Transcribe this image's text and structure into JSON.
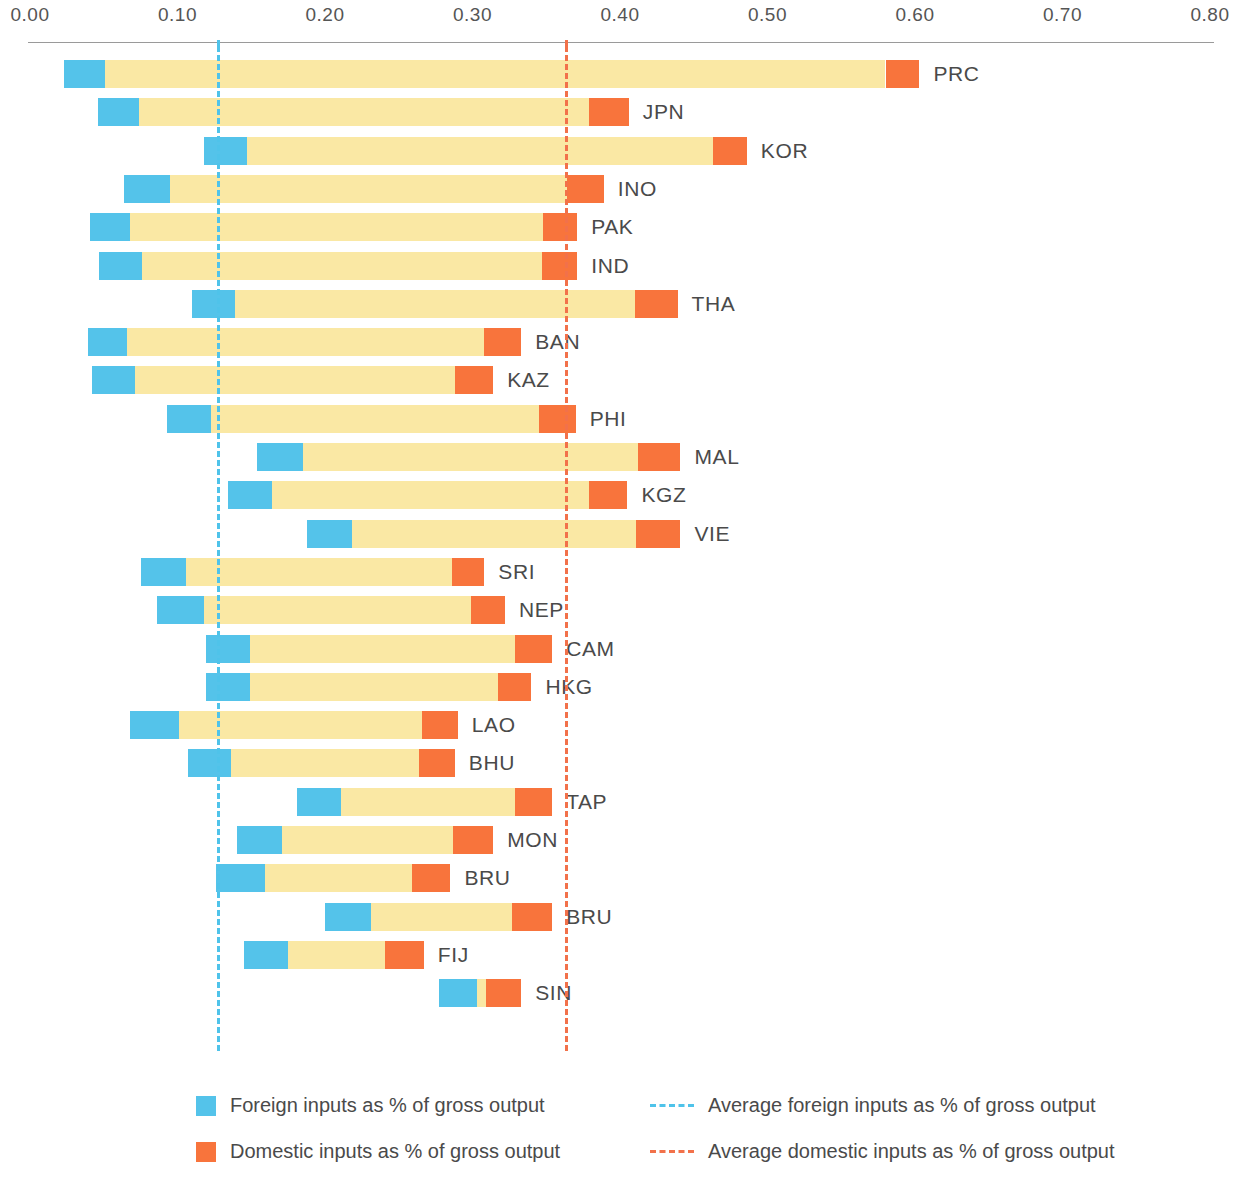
{
  "chart_data": {
    "type": "bar",
    "title": "",
    "subtitle": "",
    "xlabel": "",
    "ylabel": "",
    "orientation": "horizontal",
    "stacked": true,
    "grid": false,
    "xlim": [
      0.0,
      0.8
    ],
    "xticks": [
      0.0,
      0.1,
      0.2,
      0.3,
      0.4,
      0.5,
      0.6,
      0.7,
      0.8
    ],
    "xtick_labels": [
      "0.00",
      "0.10",
      "0.20",
      "0.30",
      "0.40",
      "0.50",
      "0.60",
      "0.70",
      "0.80"
    ],
    "legend_position": "bottom",
    "series": [
      {
        "name": "Foreign inputs as % of gross output",
        "color": "#54c3ea"
      },
      {
        "name": "Domestic inputs as % of gross output",
        "color": "#f8743c"
      }
    ],
    "reference_lines": [
      {
        "name": "Average foreign inputs as % of gross output",
        "value": 0.127,
        "color": "#4fc3ea",
        "style": "dashed"
      },
      {
        "name": "Average domestic inputs as % of gross output",
        "value": 0.363,
        "color": "#f2714a",
        "style": "dashed"
      }
    ],
    "categories": [
      "PRC",
      "JPN",
      "KOR",
      "INO",
      "PAK",
      "IND",
      "THA",
      "BAN",
      "KAZ",
      "PHI",
      "MAL",
      "KGZ",
      "VIE",
      "SRI",
      "NEP",
      "CAM",
      "HKG",
      "LAO",
      "BHU",
      "TAP",
      "MON",
      "BRU",
      "BRU",
      "FIJ",
      "SIN"
    ],
    "bars": [
      {
        "label": "PRC",
        "start": 0.023,
        "foreign": 0.028,
        "middle": 0.529,
        "domestic": 0.023,
        "end": 0.603
      },
      {
        "label": "JPN",
        "start": 0.046,
        "foreign": 0.028,
        "middle": 0.305,
        "domestic": 0.027,
        "end": 0.406
      },
      {
        "label": "KOR",
        "start": 0.118,
        "foreign": 0.029,
        "middle": 0.316,
        "domestic": 0.023,
        "end": 0.486
      },
      {
        "label": "INO",
        "start": 0.064,
        "foreign": 0.031,
        "middle": 0.269,
        "domestic": 0.025,
        "end": 0.389
      },
      {
        "label": "PAK",
        "start": 0.041,
        "foreign": 0.027,
        "middle": 0.28,
        "domestic": 0.023,
        "end": 0.371
      },
      {
        "label": "IND",
        "start": 0.047,
        "foreign": 0.029,
        "middle": 0.271,
        "domestic": 0.024,
        "end": 0.371
      },
      {
        "label": "THA",
        "start": 0.11,
        "foreign": 0.029,
        "middle": 0.271,
        "domestic": 0.029,
        "end": 0.439
      },
      {
        "label": "BAN",
        "start": 0.039,
        "foreign": 0.027,
        "middle": 0.242,
        "domestic": 0.025,
        "end": 0.333
      },
      {
        "label": "KAZ",
        "start": 0.042,
        "foreign": 0.029,
        "middle": 0.217,
        "domestic": 0.026,
        "end": 0.314
      },
      {
        "label": "PHI",
        "start": 0.093,
        "foreign": 0.03,
        "middle": 0.222,
        "domestic": 0.025,
        "end": 0.37
      },
      {
        "label": "MAL",
        "start": 0.154,
        "foreign": 0.031,
        "middle": 0.227,
        "domestic": 0.029,
        "end": 0.441
      },
      {
        "label": "KGZ",
        "start": 0.134,
        "foreign": 0.03,
        "middle": 0.215,
        "domestic": 0.026,
        "end": 0.405
      },
      {
        "label": "VIE",
        "start": 0.188,
        "foreign": 0.03,
        "middle": 0.193,
        "domestic": 0.03,
        "end": 0.441
      },
      {
        "label": "SRI",
        "start": 0.075,
        "foreign": 0.031,
        "middle": 0.18,
        "domestic": 0.022,
        "end": 0.308
      },
      {
        "label": "NEP",
        "start": 0.086,
        "foreign": 0.032,
        "middle": 0.181,
        "domestic": 0.023,
        "end": 0.322
      },
      {
        "label": "CAM",
        "start": 0.119,
        "foreign": 0.03,
        "middle": 0.18,
        "domestic": 0.025,
        "end": 0.354
      },
      {
        "label": "HKG",
        "start": 0.119,
        "foreign": 0.03,
        "middle": 0.168,
        "domestic": 0.023,
        "end": 0.34
      },
      {
        "label": "LAO",
        "start": 0.068,
        "foreign": 0.033,
        "middle": 0.165,
        "domestic": 0.024,
        "end": 0.29
      },
      {
        "label": "BHU",
        "start": 0.107,
        "foreign": 0.029,
        "middle": 0.128,
        "domestic": 0.024,
        "end": 0.288
      },
      {
        "label": "TAP",
        "start": 0.181,
        "foreign": 0.03,
        "middle": 0.118,
        "domestic": 0.025,
        "end": 0.354
      },
      {
        "label": "MON",
        "start": 0.14,
        "foreign": 0.031,
        "middle": 0.116,
        "domestic": 0.027,
        "end": 0.314
      },
      {
        "label": "BRU",
        "start": 0.126,
        "foreign": 0.033,
        "middle": 0.1,
        "domestic": 0.026,
        "end": 0.285
      },
      {
        "label": "BRU",
        "start": 0.2,
        "foreign": 0.031,
        "middle": 0.096,
        "domestic": 0.027,
        "end": 0.354
      },
      {
        "label": "FIJ",
        "start": 0.145,
        "foreign": 0.03,
        "middle": 0.066,
        "domestic": 0.026,
        "end": 0.267
      },
      {
        "label": "SIN",
        "start": 0.277,
        "foreign": 0.026,
        "middle": 0.006,
        "domestic": 0.024,
        "end": 0.333
      }
    ]
  },
  "axis": {
    "ticks": [
      {
        "label": "0.00",
        "value": 0.0
      },
      {
        "label": "0.10",
        "value": 0.1
      },
      {
        "label": "0.20",
        "value": 0.2
      },
      {
        "label": "0.30",
        "value": 0.3
      },
      {
        "label": "0.40",
        "value": 0.4
      },
      {
        "label": "0.50",
        "value": 0.5
      },
      {
        "label": "0.60",
        "value": 0.6
      },
      {
        "label": "0.70",
        "value": 0.7
      },
      {
        "label": "0.80",
        "value": 0.8
      }
    ]
  },
  "legend": {
    "items": [
      {
        "kind": "swatch",
        "color": "#54c3ea",
        "label": "Foreign inputs as % of gross output"
      },
      {
        "kind": "swatch",
        "color": "#f8743c",
        "label": "Domestic inputs as % of gross output"
      },
      {
        "kind": "dash",
        "color": "#4fc3ea",
        "label": "Average foreign inputs as % of gross output"
      },
      {
        "kind": "dash",
        "color": "#f2714a",
        "label": "Average domestic inputs as % of gross output"
      }
    ]
  }
}
